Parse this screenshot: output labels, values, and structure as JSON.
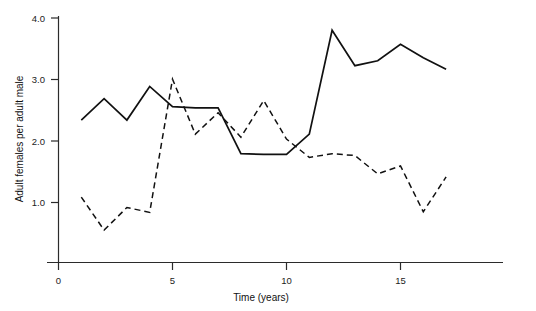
{
  "chart_data": {
    "type": "line",
    "title": "",
    "xlabel": "Time (years)",
    "ylabel": "Adult females per adult male",
    "xlim": [
      0,
      19.5
    ],
    "ylim": [
      0,
      4.3
    ],
    "xticks": [
      0,
      5,
      10,
      15
    ],
    "xtick_labels": [
      "0",
      "5",
      "10",
      "15"
    ],
    "yticks": [
      1.0,
      2.0,
      3.0,
      4.0
    ],
    "ytick_labels": [
      "1.0",
      "2.0",
      "3.0",
      "4.0"
    ],
    "grid": false,
    "legend": "none",
    "series": [
      {
        "name": "solid-series",
        "style": "solid",
        "x": [
          1,
          2,
          3,
          4,
          5,
          6,
          7,
          8,
          9,
          10,
          11,
          12,
          13,
          14,
          15,
          16,
          17
        ],
        "values": [
          2.33,
          2.68,
          2.33,
          2.88,
          2.55,
          2.53,
          2.53,
          1.78,
          1.77,
          1.77,
          2.1,
          3.8,
          3.22,
          3.3,
          3.57,
          3.35,
          3.16
        ]
      },
      {
        "name": "dashed-series",
        "style": "dashed",
        "x": [
          1,
          2,
          3,
          4,
          5,
          6,
          7,
          8,
          9,
          10,
          11,
          12,
          13,
          14,
          15,
          16,
          17
        ],
        "values": [
          1.07,
          0.53,
          0.9,
          0.82,
          3.0,
          2.1,
          2.45,
          2.05,
          2.65,
          2.02,
          1.72,
          1.78,
          1.75,
          1.45,
          1.58,
          0.83,
          1.4
        ]
      }
    ]
  },
  "axis": {
    "y_title": "Adult females per adult male",
    "x_title": "Time (years)",
    "x_zero_label": "0"
  },
  "colors": {
    "axis": "#2b2b2b",
    "line": "#111111",
    "background": "#ffffff"
  }
}
